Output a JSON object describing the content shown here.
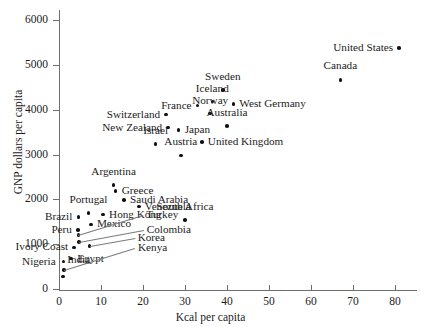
{
  "chart_data": {
    "type": "scatter",
    "title": "",
    "xlabel": "Kcal per capita",
    "ylabel": "GNP dollars per capita",
    "xlim": [
      0,
      85
    ],
    "ylim": [
      0,
      6300
    ],
    "xticks": [
      0,
      10,
      20,
      30,
      40,
      50,
      60,
      70,
      80
    ],
    "yticks": [
      0,
      1000,
      2000,
      3000,
      4000,
      5000,
      6000
    ],
    "xtick_labels": [
      "0",
      "10",
      "20",
      "30",
      "40",
      "50",
      "60",
      "70",
      "80"
    ],
    "ytick_labels": [
      "0",
      "1000",
      "2000",
      "3000",
      "4000",
      "5000",
      "6000"
    ],
    "grid": false,
    "legend": null,
    "point_color": "#111111",
    "axis_color": "#6f6f6f",
    "points": [
      {
        "label": "United States",
        "x": 81.0,
        "y": 5380,
        "lx": -6,
        "ly": 0,
        "anchor": "left",
        "leader": false
      },
      {
        "label": "Canada",
        "x": 67.0,
        "y": 4660,
        "lx": 0,
        "ly": -14,
        "anchor": "center",
        "leader": false
      },
      {
        "label": "Sweden",
        "x": 39.0,
        "y": 4440,
        "lx": 0,
        "ly": -13,
        "anchor": "center",
        "leader": false
      },
      {
        "label": "Iceland",
        "x": 36.5,
        "y": 4180,
        "lx": 0,
        "ly": -13,
        "anchor": "center",
        "leader": false
      },
      {
        "label": "West Germany",
        "x": 41.5,
        "y": 4120,
        "lx": 6,
        "ly": 0,
        "anchor": "right",
        "leader": false
      },
      {
        "label": "France",
        "x": 33.0,
        "y": 4090,
        "lx": -6,
        "ly": 0,
        "anchor": "left",
        "leader": false
      },
      {
        "label": "Norway",
        "x": 36.0,
        "y": 3910,
        "lx": 0,
        "ly": -13,
        "anchor": "center",
        "leader": false
      },
      {
        "label": "Switzerland",
        "x": 25.5,
        "y": 3890,
        "lx": -6,
        "ly": 0,
        "anchor": "left",
        "leader": false
      },
      {
        "label": "Australia",
        "x": 40.0,
        "y": 3630,
        "lx": 0,
        "ly": -13,
        "anchor": "center",
        "leader": false
      },
      {
        "label": "New Zealand",
        "x": 26.0,
        "y": 3600,
        "lx": -6,
        "ly": 0,
        "anchor": "left",
        "leader": false
      },
      {
        "label": "Japan",
        "x": 28.5,
        "y": 3550,
        "lx": 6,
        "ly": 0,
        "anchor": "right",
        "leader": false
      },
      {
        "label": "United Kingdom",
        "x": 34.0,
        "y": 3280,
        "lx": 6,
        "ly": 0,
        "anchor": "right",
        "leader": false
      },
      {
        "label": "Israel",
        "x": 23.0,
        "y": 3230,
        "lx": 0,
        "ly": -13,
        "anchor": "center",
        "leader": false
      },
      {
        "label": "Austria",
        "x": 29.0,
        "y": 2980,
        "lx": 0,
        "ly": -13,
        "anchor": "center",
        "leader": false
      },
      {
        "label": "Argentina",
        "x": 13.0,
        "y": 2320,
        "lx": 0,
        "ly": -13,
        "anchor": "center",
        "leader": false
      },
      {
        "label": "Greece",
        "x": 13.5,
        "y": 2180,
        "lx": 6,
        "ly": 0,
        "anchor": "right",
        "leader": false
      },
      {
        "label": "Saudi Arabia",
        "x": 15.5,
        "y": 1980,
        "lx": 6,
        "ly": 0,
        "anchor": "right",
        "leader": false
      },
      {
        "label": "Venezuela",
        "x": 19.0,
        "y": 1840,
        "lx": 6,
        "ly": 0,
        "anchor": "right",
        "leader": false
      },
      {
        "label": "Portugal",
        "x": 7.0,
        "y": 1690,
        "lx": 0,
        "ly": -13,
        "anchor": "center",
        "leader": false
      },
      {
        "label": "Hong Kong",
        "x": 10.5,
        "y": 1660,
        "lx": 6,
        "ly": 0,
        "anchor": "right",
        "leader": false
      },
      {
        "label": "Brazil",
        "x": 4.6,
        "y": 1610,
        "lx": -6,
        "ly": 0,
        "anchor": "left",
        "leader": false
      },
      {
        "label": "South Africa",
        "x": 30.0,
        "y": 1540,
        "lx": 0,
        "ly": -13,
        "anchor": "center",
        "leader": false
      },
      {
        "label": "Mexico",
        "x": 7.6,
        "y": 1440,
        "lx": 6,
        "ly": 0,
        "anchor": "right",
        "leader": false
      },
      {
        "label": "Peru",
        "x": 4.5,
        "y": 1310,
        "lx": -6,
        "ly": 0,
        "anchor": "left",
        "leader": false
      },
      {
        "label": "Turkey",
        "x": 4.6,
        "y": 1200,
        "lx": 68,
        "ly": -20,
        "anchor": "right",
        "leader": true
      },
      {
        "label": "Colombia",
        "x": 4.7,
        "y": 1050,
        "lx": 68,
        "ly": -12,
        "anchor": "right",
        "leader": true
      },
      {
        "label": "Korea",
        "x": 7.3,
        "y": 960,
        "lx": 48,
        "ly": -8,
        "anchor": "right",
        "leader": true
      },
      {
        "label": "Ivory Coast",
        "x": 3.6,
        "y": 930,
        "lx": -6,
        "ly": 0,
        "anchor": "left",
        "leader": false
      },
      {
        "label": "Egypt",
        "x": 2.9,
        "y": 680,
        "lx": 6,
        "ly": 0,
        "anchor": "right",
        "leader": false
      },
      {
        "label": "Nigeria",
        "x": 1.1,
        "y": 610,
        "lx": -8,
        "ly": 0,
        "anchor": "left",
        "leader": false
      },
      {
        "label": "Kenya",
        "x": 1.2,
        "y": 430,
        "lx": 74,
        "ly": -22,
        "anchor": "right",
        "leader": true
      },
      {
        "label": "India",
        "x": 1.0,
        "y": 280,
        "lx": 4,
        "ly": -16,
        "anchor": "right",
        "leader": false
      }
    ]
  }
}
